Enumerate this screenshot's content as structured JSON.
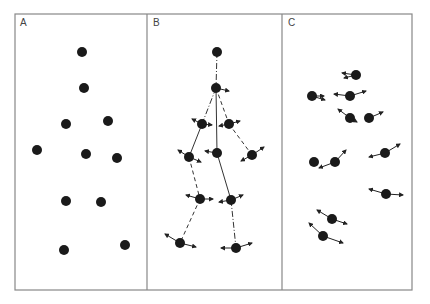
{
  "figure": {
    "width": 430,
    "height": 304,
    "frame": {
      "x": 15,
      "y": 14,
      "w": 397,
      "h": 276,
      "color": "#888888"
    },
    "dividers": [
      147,
      282
    ],
    "node_color": "#1a1a1a",
    "node_radius": 5,
    "arrow_color": "#222222"
  },
  "panels": [
    {
      "label": "A",
      "label_pos": [
        20,
        17
      ],
      "nodes": [
        [
          82,
          52
        ],
        [
          84,
          88
        ],
        [
          66,
          124
        ],
        [
          108,
          121
        ],
        [
          37,
          150
        ],
        [
          86,
          154
        ],
        [
          117,
          158
        ],
        [
          66,
          201
        ],
        [
          101,
          202
        ],
        [
          64,
          250
        ],
        [
          125,
          245
        ]
      ],
      "edges": [],
      "arrows": []
    },
    {
      "label": "B",
      "label_pos": [
        153,
        17
      ],
      "nodes": [
        [
          217,
          52
        ],
        [
          216,
          88
        ],
        [
          202,
          124
        ],
        [
          229,
          124
        ],
        [
          189,
          157
        ],
        [
          217,
          153
        ],
        [
          252,
          155
        ],
        [
          200,
          199
        ],
        [
          231,
          200
        ],
        [
          180,
          243
        ],
        [
          236,
          248
        ]
      ],
      "edges": [
        {
          "from": 0,
          "to": 1,
          "style": "dashdot"
        },
        {
          "from": 1,
          "to": 2,
          "style": "dashdot"
        },
        {
          "from": 1,
          "to": 3,
          "style": "dashed"
        },
        {
          "from": 1,
          "to": 5,
          "style": "solid"
        },
        {
          "from": 2,
          "to": 4,
          "style": "solid"
        },
        {
          "from": 3,
          "to": 6,
          "style": "dashed"
        },
        {
          "from": 4,
          "to": 7,
          "style": "dashed"
        },
        {
          "from": 5,
          "to": 8,
          "style": "solid"
        },
        {
          "from": 7,
          "to": 9,
          "style": "dashed"
        },
        {
          "from": 8,
          "to": 10,
          "style": "dashdot"
        }
      ],
      "arrows": [
        [
          [
            216,
            88
          ],
          [
            229,
            91
          ]
        ],
        [
          [
            202,
            124
          ],
          [
            192,
            119
          ]
        ],
        [
          [
            202,
            124
          ],
          [
            212,
            125
          ]
        ],
        [
          [
            229,
            124
          ],
          [
            219,
            126
          ]
        ],
        [
          [
            229,
            124
          ],
          [
            240,
            121
          ]
        ],
        [
          [
            189,
            157
          ],
          [
            178,
            150
          ]
        ],
        [
          [
            189,
            157
          ],
          [
            201,
            162
          ]
        ],
        [
          [
            217,
            153
          ],
          [
            205,
            151
          ]
        ],
        [
          [
            252,
            155
          ],
          [
            264,
            147
          ]
        ],
        [
          [
            252,
            155
          ],
          [
            241,
            161
          ]
        ],
        [
          [
            200,
            199
          ],
          [
            186,
            195
          ]
        ],
        [
          [
            200,
            199
          ],
          [
            213,
            199
          ]
        ],
        [
          [
            231,
            200
          ],
          [
            219,
            202
          ]
        ],
        [
          [
            231,
            200
          ],
          [
            243,
            195
          ]
        ],
        [
          [
            180,
            243
          ],
          [
            165,
            234
          ]
        ],
        [
          [
            180,
            243
          ],
          [
            196,
            247
          ]
        ],
        [
          [
            236,
            248
          ],
          [
            221,
            248
          ]
        ],
        [
          [
            236,
            248
          ],
          [
            252,
            243
          ]
        ]
      ]
    },
    {
      "label": "C",
      "label_pos": [
        288,
        17
      ],
      "nodes": [
        [
          356,
          75
        ],
        [
          312,
          96
        ],
        [
          350,
          96
        ],
        [
          350,
          118
        ],
        [
          369,
          118
        ],
        [
          314,
          162
        ],
        [
          335,
          162
        ],
        [
          385,
          153
        ],
        [
          386,
          194
        ],
        [
          332,
          219
        ],
        [
          323,
          236
        ]
      ],
      "edges": [],
      "arrows": [
        [
          [
            356,
            75
          ],
          [
            342,
            73
          ]
        ],
        [
          [
            356,
            75
          ],
          [
            344,
            78
          ]
        ],
        [
          [
            312,
            96
          ],
          [
            324,
            96
          ]
        ],
        [
          [
            312,
            96
          ],
          [
            325,
            100
          ]
        ],
        [
          [
            350,
            96
          ],
          [
            334,
            94
          ]
        ],
        [
          [
            350,
            96
          ],
          [
            366,
            91
          ]
        ],
        [
          [
            350,
            118
          ],
          [
            338,
            109
          ]
        ],
        [
          [
            350,
            118
          ],
          [
            357,
            122
          ]
        ],
        [
          [
            369,
            118
          ],
          [
            383,
            112
          ]
        ],
        [
          [
            314,
            162
          ],
          [
            0,
            0
          ]
        ],
        [
          [
            335,
            162
          ],
          [
            319,
            168
          ]
        ],
        [
          [
            335,
            162
          ],
          [
            346,
            150
          ]
        ],
        [
          [
            385,
            153
          ],
          [
            369,
            157
          ]
        ],
        [
          [
            385,
            153
          ],
          [
            400,
            144
          ]
        ],
        [
          [
            386,
            194
          ],
          [
            369,
            189
          ]
        ],
        [
          [
            386,
            194
          ],
          [
            403,
            195
          ]
        ],
        [
          [
            332,
            219
          ],
          [
            317,
            210
          ]
        ],
        [
          [
            332,
            219
          ],
          [
            347,
            224
          ]
        ],
        [
          [
            323,
            236
          ],
          [
            309,
            223
          ]
        ],
        [
          [
            323,
            236
          ],
          [
            343,
            243
          ]
        ]
      ]
    }
  ]
}
